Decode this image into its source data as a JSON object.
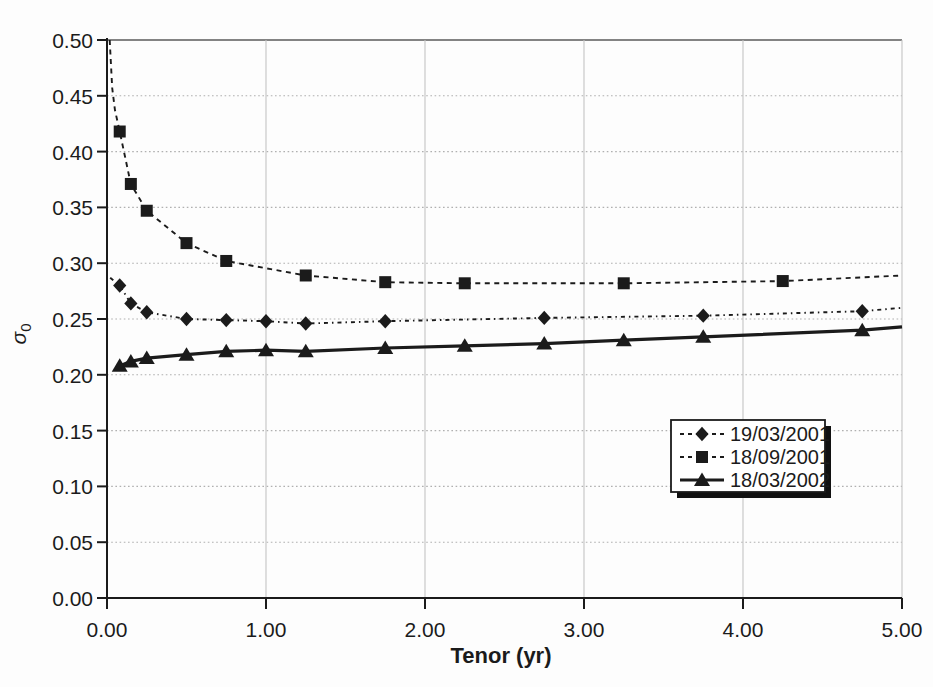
{
  "figure": {
    "kind": "scanned line chart, black on white",
    "background_color": "#fdfdfd",
    "ink_color": "#1b1b1b",
    "gridline_color_dotted": "#b0b0b0",
    "gridline_color_solid": "#c4c4c4",
    "top_border_color": "#5a5a5a"
  },
  "chart_data": {
    "type": "line",
    "title": "",
    "xlabel": "Tenor (yr)",
    "ylabel": {
      "symbol": "σ",
      "subscript": "0"
    },
    "xlim": [
      0,
      5
    ],
    "ylim": [
      0,
      0.5
    ],
    "grid": {
      "horizontal": "dotted every 0.05",
      "vertical": "solid every 1.00",
      "top_border_at": 0.5
    },
    "legend": {
      "position": "inside lower-right",
      "entries": [
        "19/03/2001",
        "18/09/2001",
        "18/03/2002"
      ]
    },
    "xticks": [
      {
        "value": 0,
        "label": "0.00"
      },
      {
        "value": 1,
        "label": "1.00"
      },
      {
        "value": 2,
        "label": "2.00"
      },
      {
        "value": 3,
        "label": "3.00"
      },
      {
        "value": 4,
        "label": "4.00"
      },
      {
        "value": 5,
        "label": "5.00"
      }
    ],
    "yticks": [
      {
        "value": 0.0,
        "label": "0.00"
      },
      {
        "value": 0.05,
        "label": "0.05"
      },
      {
        "value": 0.1,
        "label": "0.10"
      },
      {
        "value": 0.15,
        "label": "0.15"
      },
      {
        "value": 0.2,
        "label": "0.20"
      },
      {
        "value": 0.25,
        "label": "0.25"
      },
      {
        "value": 0.3,
        "label": "0.30"
      },
      {
        "value": 0.35,
        "label": "0.35"
      },
      {
        "value": 0.4,
        "label": "0.40"
      },
      {
        "value": 0.45,
        "label": "0.45"
      }
    ],
    "series": [
      {
        "name": "18/09/2001",
        "marker": "square",
        "line": "dashed",
        "x": [
          0.08,
          0.15,
          0.25,
          0.5,
          0.75,
          1.25,
          1.75,
          2.25,
          3.25,
          4.25
        ],
        "y": [
          0.418,
          0.371,
          0.347,
          0.318,
          0.302,
          0.289,
          0.283,
          0.282,
          0.282,
          0.284
        ],
        "line_start": [
          [
            0.017,
            0.5
          ],
          [
            0.033,
            0.457
          ],
          [
            0.05,
            0.437
          ]
        ],
        "line_end": [
          5.0,
          0.289
        ]
      },
      {
        "name": "19/03/2001",
        "marker": "diamond",
        "line": "dash-dot",
        "x": [
          0.08,
          0.15,
          0.25,
          0.5,
          0.75,
          1.0,
          1.25,
          1.75,
          2.75,
          3.75,
          4.75
        ],
        "y": [
          0.28,
          0.264,
          0.256,
          0.25,
          0.249,
          0.248,
          0.246,
          0.248,
          0.251,
          0.253,
          0.257
        ],
        "line_start": [
          [
            0.02,
            0.287
          ]
        ],
        "line_end": [
          5.0,
          0.26
        ]
      },
      {
        "name": "18/03/2002",
        "marker": "triangle",
        "line": "solid",
        "x": [
          0.08,
          0.15,
          0.25,
          0.5,
          0.75,
          1.0,
          1.25,
          1.75,
          2.25,
          2.75,
          3.25,
          3.75,
          4.75
        ],
        "y": [
          0.208,
          0.212,
          0.215,
          0.218,
          0.221,
          0.222,
          0.221,
          0.224,
          0.226,
          0.228,
          0.231,
          0.234,
          0.24
        ],
        "line_start": [],
        "line_end": [
          5.0,
          0.243
        ]
      }
    ]
  }
}
